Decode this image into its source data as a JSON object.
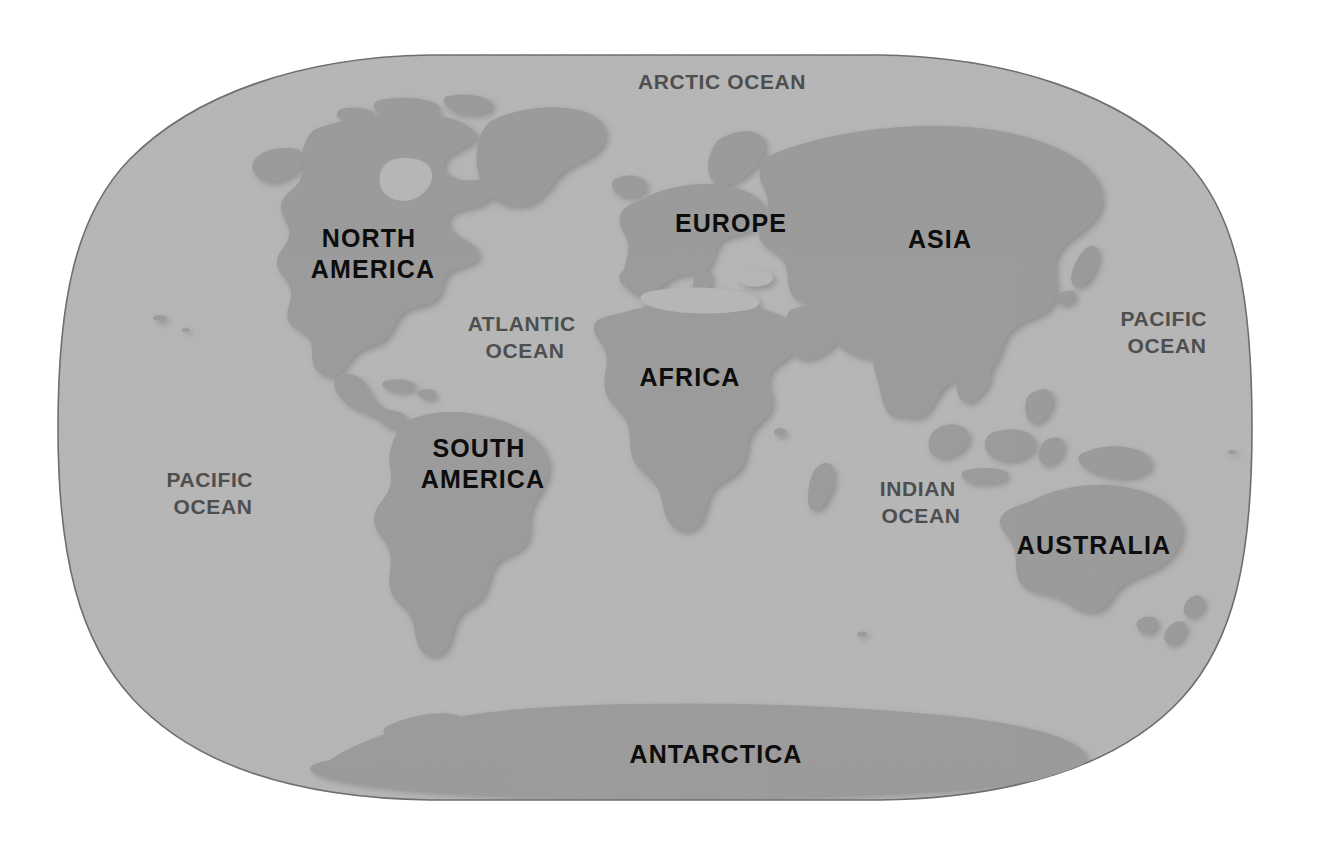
{
  "map": {
    "title": "World Map",
    "projection": "winkel-tripel",
    "background_color": "#ffffff",
    "ocean_color": "#b6b6b6",
    "land_color": "#9b9b9b",
    "outline_color": "#6e6e6e",
    "continent_label_color": "#0d0d0d",
    "ocean_label_color": "#4e4e4e",
    "bounds": {
      "x": 55,
      "y": 55,
      "width": 1195,
      "height": 745
    }
  },
  "continents": [
    {
      "id": "north-america",
      "name": "NORTH",
      "name2": "AMERICA",
      "x": 373,
      "y": 240,
      "font_size": 25
    },
    {
      "id": "south-america",
      "name": "SOUTH",
      "name2": "AMERICA",
      "x": 483,
      "y": 450,
      "font_size": 25
    },
    {
      "id": "europe",
      "name": "EUROPE",
      "name2": "",
      "x": 731,
      "y": 225,
      "font_size": 25
    },
    {
      "id": "africa",
      "name": "AFRICA",
      "name2": "",
      "x": 690,
      "y": 379,
      "font_size": 25
    },
    {
      "id": "asia",
      "name": "ASIA",
      "name2": "",
      "x": 940,
      "y": 241,
      "font_size": 25
    },
    {
      "id": "australia",
      "name": "AUSTRALIA",
      "name2": "",
      "x": 1094,
      "y": 547,
      "font_size": 25
    },
    {
      "id": "antarctica",
      "name": "ANTARCTICA",
      "name2": "",
      "x": 716,
      "y": 756,
      "font_size": 25
    }
  ],
  "oceans": [
    {
      "id": "arctic-ocean",
      "name": "ARCTIC",
      "name2": "OCEAN",
      "inline": true,
      "x": 722,
      "y": 83,
      "font_size": 21
    },
    {
      "id": "atlantic-ocean",
      "name": "ATLANTIC",
      "name2": "OCEAN",
      "inline": false,
      "x": 525,
      "y": 325,
      "font_size": 21
    },
    {
      "id": "pacific-ocean-west",
      "name": "PACIFIC",
      "name2": "OCEAN",
      "inline": false,
      "x": 213,
      "y": 481,
      "font_size": 21
    },
    {
      "id": "pacific-ocean-east",
      "name": "PACIFIC",
      "name2": "OCEAN",
      "inline": false,
      "x": 1167,
      "y": 320,
      "font_size": 21
    },
    {
      "id": "indian-ocean",
      "name": "INDIAN",
      "name2": "OCEAN",
      "inline": false,
      "x": 921,
      "y": 490,
      "font_size": 21
    }
  ]
}
